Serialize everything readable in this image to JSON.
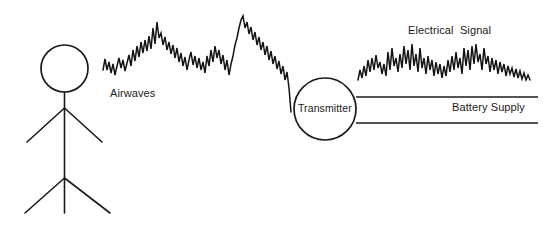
{
  "diagram": {
    "background_color": "#ffffff",
    "ink_color": "#1a1a1a",
    "width": 550,
    "height": 225,
    "labels": {
      "airwaves": "Airwaves",
      "transmitter": "Transmitter",
      "electrical_signal": "Electrical  Signal",
      "battery_supply": "Battery Supply"
    },
    "nodes": {
      "person": {
        "name": "stick-figure-person",
        "head_center_x": 64.5,
        "head_center_y": 68.5,
        "head_radius": 23.5,
        "body_top_y": 92,
        "body_bottom_y": 213,
        "arm_branch_y": 108,
        "arm_left_end_x": 27,
        "arm_left_end_y": 142,
        "arm_right_end_x": 102,
        "arm_right_end_y": 142,
        "leg_branch_y": 178,
        "leg_left_end_x": 25,
        "leg_left_end_y": 213,
        "leg_right_end_x": 110,
        "leg_right_end_y": 213
      },
      "transmitter": {
        "name": "transmitter-circle",
        "center_x": 325,
        "center_y": 109,
        "radius": 31
      }
    },
    "wires": {
      "battery_top": {
        "x1": 356,
        "y1": 97,
        "x2": 538,
        "y2": 97
      },
      "battery_bottom": {
        "x1": 356,
        "y1": 123,
        "x2": 538,
        "y2": 123
      }
    },
    "waveforms": {
      "airwaves": {
        "name": "airwaves-waveform",
        "x_start": 103,
        "x_end": 291,
        "y_top": 14,
        "y_bottom": 112,
        "description": "noisy jagged signal from person toward transmitter"
      },
      "electrical_signal": {
        "name": "electrical-signal-waveform",
        "x_start": 358,
        "x_end": 531,
        "y_top": 44,
        "y_bottom": 80,
        "description": "dense high-frequency zigzag tapering to the right"
      }
    }
  }
}
